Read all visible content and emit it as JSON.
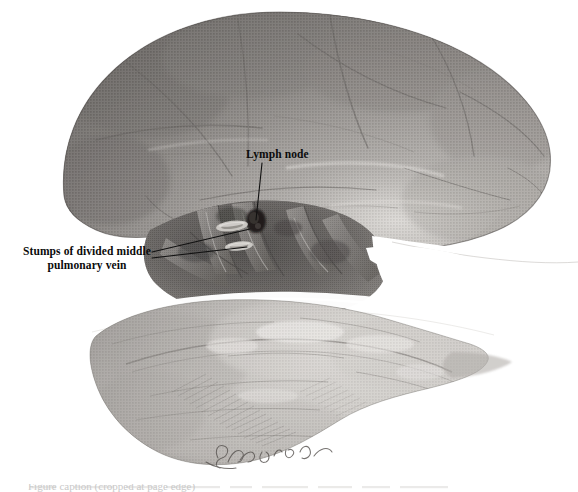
{
  "figure": {
    "kind": "anatomical-illustration",
    "medium": "grayscale halftone engraving",
    "background_color": "#ffffff",
    "ink_color": "#0b0b0b",
    "width": 578,
    "height": 492
  },
  "labels": {
    "lymph_node": {
      "text": "Lymph node",
      "x": 246,
      "y": 148
    },
    "stumps": {
      "line1": "Stumps of divided middle",
      "line2": "pulmonary vein",
      "x": 8,
      "y": 245
    }
  },
  "leaders": {
    "lymph_node": {
      "from_x": 262,
      "from_y": 163,
      "to_x": 256,
      "to_y": 222
    },
    "stump_upper": {
      "from_x": 152,
      "from_y": 252,
      "to_x": 252,
      "to_y": 229
    },
    "stump_lower": {
      "from_x": 152,
      "from_y": 258,
      "to_x": 246,
      "to_y": 247
    }
  },
  "signature": {
    "text": "artist signature",
    "x": 232,
    "y": 452
  },
  "caption": {
    "text": "Figure caption (cropped at page edge)",
    "visible": "partially-cropped"
  },
  "anatomy": {
    "regions": [
      {
        "name": "upper-lobe",
        "tone": "dark",
        "note": "Large superiorly retracted lobe occupying upper two thirds"
      },
      {
        "name": "hilum",
        "tone": "darkest",
        "note": "Central hilar structures with bronchus and vessels"
      },
      {
        "name": "vessel-stumps",
        "tone": "light-ellipse",
        "note": "Two cut venous stumps shown as pale ellipses"
      },
      {
        "name": "lymph-node",
        "tone": "very-dark",
        "note": "Dark rounded node above the vessel stumps"
      },
      {
        "name": "interlobar-fissure",
        "tone": "white-band",
        "note": "Pale band crossing the specimen obliquely"
      },
      {
        "name": "lower-lobe",
        "tone": "light",
        "note": "Lower lobe with fine cross hatching"
      }
    ]
  }
}
